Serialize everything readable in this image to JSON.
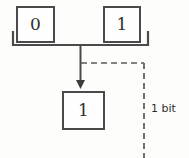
{
  "diagram": {
    "colors": {
      "stroke": "#4a4a4a",
      "dashed_stroke": "#5a5a5a",
      "text": "#2e2e2e",
      "background": "#fdfdfc"
    },
    "boxes": [
      {
        "id": "input-left",
        "value": "0"
      },
      {
        "id": "input-right",
        "value": "1"
      },
      {
        "id": "output",
        "value": "1"
      }
    ],
    "annotations": {
      "bit_label": "1 bit"
    }
  }
}
